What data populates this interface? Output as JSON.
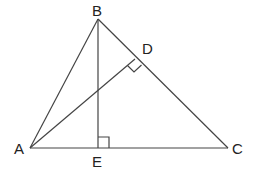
{
  "diagram": {
    "points": {
      "A": {
        "label": "A",
        "x": 30,
        "y": 148
      },
      "B": {
        "label": "B",
        "x": 98,
        "y": 19
      },
      "C": {
        "label": "C",
        "x": 228,
        "y": 148
      },
      "D": {
        "label": "D",
        "x": 135,
        "y": 59
      },
      "E": {
        "label": "E",
        "x": 98,
        "y": 148
      }
    },
    "segments": [
      "AB",
      "BC",
      "CA",
      "BE",
      "AD"
    ],
    "right_angles": [
      "BEA",
      "ADB"
    ]
  }
}
